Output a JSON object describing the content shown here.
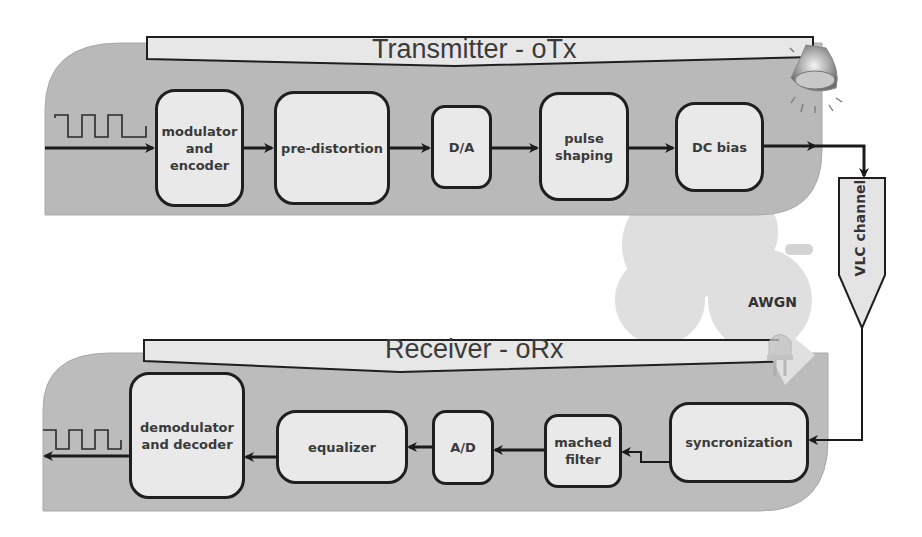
{
  "diagram": {
    "transmitter": {
      "title": "Transmitter - oTx",
      "blocks": [
        {
          "id": "modulator",
          "label": "modulator and encoder"
        },
        {
          "id": "pre-distortion",
          "label": "pre-distortion"
        },
        {
          "id": "da",
          "label": "D/A"
        },
        {
          "id": "pulse-shaping",
          "label": "pulse shaping"
        },
        {
          "id": "dc-bias",
          "label": "DC bias"
        }
      ],
      "input_signal_icon": "square-wave-icon",
      "emitter_icon": "lamp-icon"
    },
    "channel": {
      "label": "VLC channel",
      "noise_label": "AWGN",
      "noise_icon": "cloud-icon"
    },
    "receiver": {
      "title": "Receiver - oRx",
      "blocks": [
        {
          "id": "syncronization",
          "label": "syncronization"
        },
        {
          "id": "mached-filter",
          "label": "mached filter"
        },
        {
          "id": "ad",
          "label": "A/D"
        },
        {
          "id": "equalizer",
          "label": "equalizer"
        },
        {
          "id": "demodulator",
          "label": "demodulator and decoder"
        }
      ],
      "detector_icon": "led-photodiode-icon",
      "output_signal_icon": "square-wave-icon"
    },
    "colors": {
      "panel": "#b8b8b8",
      "banner": "#e6e6e6",
      "block_fill": "#e9e9e9",
      "stroke": "#1f1f1f",
      "text": "#3a3a3a"
    }
  }
}
